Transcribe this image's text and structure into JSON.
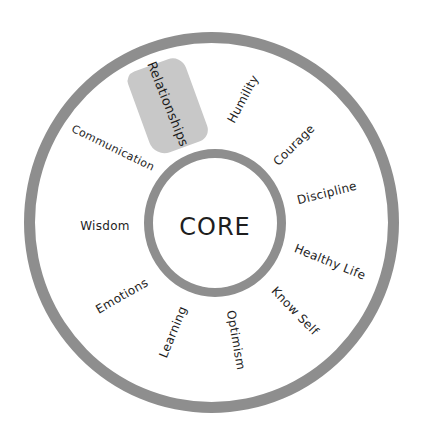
{
  "diagram": {
    "type": "concentric-circle-wheel",
    "center": {
      "label": "CORE"
    },
    "ring_color": "#8e8e8e",
    "highlight_color": "#c8c8c8",
    "text_color": "#1e1e1e",
    "highlighted_item": "Relationships",
    "items": [
      {
        "label": "Relationships",
        "x": 168,
        "y": 104,
        "rotate": 68,
        "size": 13,
        "highlighted": true
      },
      {
        "label": "Humility",
        "x": 243,
        "y": 99,
        "rotate": -62,
        "size": 12
      },
      {
        "label": "Courage",
        "x": 294,
        "y": 145,
        "rotate": -45,
        "size": 12
      },
      {
        "label": "Discipline",
        "x": 327,
        "y": 193,
        "rotate": -14,
        "size": 12
      },
      {
        "label": "Healthy Life",
        "x": 330,
        "y": 262,
        "rotate": 22,
        "size": 12
      },
      {
        "label": "Know Self",
        "x": 295,
        "y": 311,
        "rotate": 46,
        "size": 12
      },
      {
        "label": "Optimism",
        "x": 236,
        "y": 340,
        "rotate": 80,
        "size": 12
      },
      {
        "label": "Learning",
        "x": 173,
        "y": 332,
        "rotate": -68,
        "size": 12
      },
      {
        "label": "Emotions",
        "x": 122,
        "y": 296,
        "rotate": -30,
        "size": 12
      },
      {
        "label": "Wisdom",
        "x": 105,
        "y": 226,
        "rotate": 0,
        "size": 12
      },
      {
        "label": "Communication",
        "x": 113,
        "y": 148,
        "rotate": 26,
        "size": 11
      }
    ]
  }
}
